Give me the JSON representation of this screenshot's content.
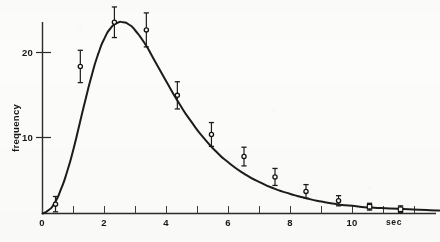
{
  "figure": {
    "background_color": "#fcfcfa",
    "ink_color": "#1c1c1c"
  },
  "chart_data": {
    "type": "scatter",
    "title": "",
    "subtitle": "",
    "xlabel": "sec",
    "ylabel": "frequency",
    "xlim": [
      0,
      12.8
    ],
    "ylim": [
      0,
      25.5
    ],
    "grid": false,
    "legend": "none",
    "x_ticks": [
      0,
      1,
      2,
      3,
      4,
      5,
      6,
      7,
      8,
      9,
      10,
      11,
      12
    ],
    "x_tick_labels": [
      "0",
      "",
      "2",
      "",
      "4",
      "",
      "6",
      "",
      "8",
      "",
      "10",
      "",
      ""
    ],
    "y_ticks": [
      10,
      20
    ],
    "y_tick_labels": [
      "10",
      "20"
    ],
    "x_unit_label": "sec",
    "series": [
      {
        "name": "observed frequency",
        "marker": "open-circle-with-error-bars",
        "x": [
          0.42,
          1.22,
          2.32,
          3.35,
          4.35,
          5.45,
          6.5,
          7.5,
          8.5,
          9.55,
          10.55,
          11.55
        ],
        "y": [
          1.1,
          17.3,
          22.5,
          21.6,
          13.9,
          9.3,
          6.7,
          4.3,
          2.6,
          1.5,
          0.8,
          0.5
        ],
        "y_err": [
          0.9,
          1.9,
          1.8,
          2.0,
          1.6,
          1.4,
          1.1,
          1.0,
          0.8,
          0.6,
          0.4,
          0.4
        ]
      },
      {
        "name": "fitted curve",
        "marker": "none",
        "x": [
          0.0,
          0.2,
          0.4,
          0.6,
          0.8,
          1.0,
          1.2,
          1.4,
          1.6,
          1.8,
          2.0,
          2.2,
          2.4,
          2.6,
          2.8,
          3.0,
          3.3,
          3.6,
          4.0,
          4.4,
          4.8,
          5.2,
          5.6,
          6.0,
          6.5,
          7.0,
          7.5,
          8.0,
          8.5,
          9.0,
          9.5,
          10.0,
          10.6,
          11.2,
          11.8,
          12.4,
          12.8
        ],
        "y": [
          0.0,
          0.4,
          1.3,
          2.9,
          5.0,
          7.6,
          10.6,
          13.6,
          16.4,
          18.8,
          20.6,
          21.8,
          22.4,
          22.5,
          22.2,
          21.5,
          20.0,
          18.1,
          15.5,
          13.0,
          10.8,
          8.9,
          7.3,
          6.0,
          4.7,
          3.7,
          2.9,
          2.3,
          1.8,
          1.4,
          1.1,
          0.9,
          0.7,
          0.6,
          0.5,
          0.4,
          0.35
        ]
      },
      {
        "name": "tail markers",
        "marker": "open-square",
        "x": [
          10.55,
          11.55
        ],
        "y": [
          0.8,
          0.5
        ],
        "y_err": [
          0.0,
          0.0
        ]
      }
    ],
    "peak": {
      "x": 2.55,
      "y": 22.5
    }
  }
}
